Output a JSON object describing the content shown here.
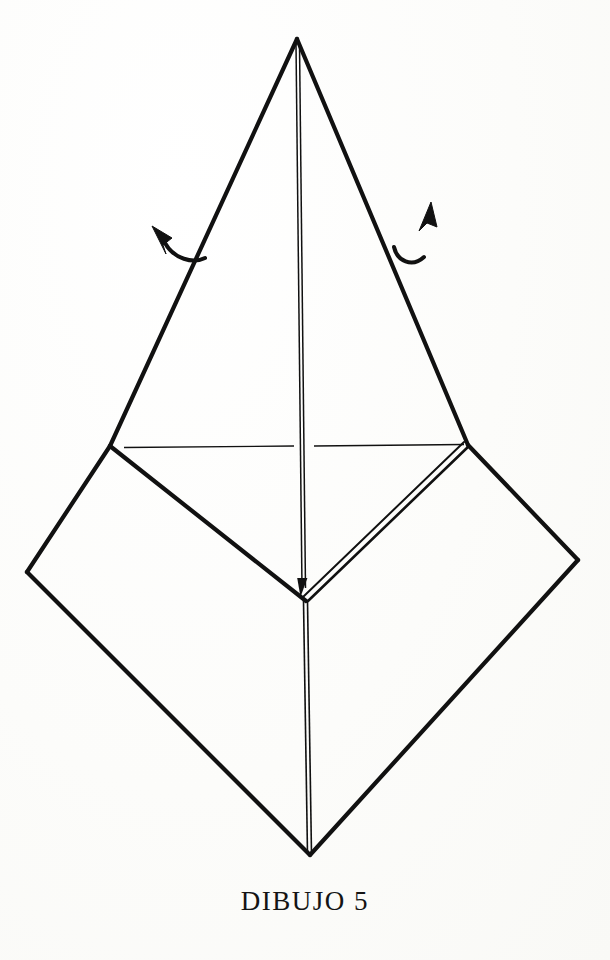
{
  "document": {
    "caption": "DIBUJO 5",
    "figure_title": "DIBUJO 5",
    "background_color": "#fdfdfc",
    "ink_color": "#111111"
  },
  "figure": {
    "type": "origami-fold-diagram",
    "stroke_color": "#111111",
    "thick_stroke_width": 4.2,
    "thin_stroke_width": 1.2,
    "points": {
      "apex": [
        297,
        37
      ],
      "left_junction": [
        110,
        446
      ],
      "right_junction": [
        468,
        445
      ],
      "center_v_junction": [
        306,
        600
      ],
      "diamond_left": [
        27,
        572
      ],
      "diamond_right": [
        578,
        560
      ],
      "diamond_bottom": [
        310,
        855
      ],
      "spine_top": [
        297,
        43
      ],
      "spine_mid": [
        303,
        460
      ],
      "spine_arrow_tip": [
        305,
        588
      ]
    },
    "edges": [
      {
        "name": "upper-left-edge",
        "from": "apex",
        "to": "left_junction",
        "style": "thick-single"
      },
      {
        "name": "upper-right-edge",
        "from": "apex",
        "to": "right_junction",
        "style": "thick-single"
      },
      {
        "name": "center-spine-upper",
        "from": "apex",
        "to": "spine_arrow_tip",
        "style": "thin-double"
      },
      {
        "name": "inner-left-diagonal",
        "from": "left_junction",
        "to": "center_v_junction",
        "style": "thick-single"
      },
      {
        "name": "inner-right-diagonal",
        "from": "right_junction",
        "to": "center_v_junction",
        "style": "thick-double"
      },
      {
        "name": "diamond-upper-left-edge",
        "from": "left_junction",
        "to": "diamond_left",
        "style": "thick-single"
      },
      {
        "name": "diamond-upper-right-edge",
        "from": "right_junction",
        "to": "diamond_right",
        "style": "thick-single"
      },
      {
        "name": "diamond-lower-left-edge",
        "from": "diamond_left",
        "to": "diamond_bottom",
        "style": "thick-single"
      },
      {
        "name": "diamond-lower-right-edge",
        "from": "diamond_right",
        "to": "diamond_bottom",
        "style": "thick-single"
      },
      {
        "name": "center-spine-lower",
        "from": "center_v_junction",
        "to": "diamond_bottom",
        "style": "thin-double"
      }
    ],
    "reference_line": {
      "name": "horizontal-crease-reference",
      "style": "thin-single",
      "left_segment": [
        [
          124,
          447
        ],
        [
          294,
          446
        ]
      ],
      "right_segment": [
        [
          314,
          446
        ],
        [
          464,
          444
        ]
      ]
    },
    "arrows": [
      {
        "name": "left-fold-arrow",
        "direction": "up-left",
        "tail": [
          203,
          257
        ],
        "head_tip": [
          152,
          226
        ],
        "description": "curved arrow indicating left flap folds upward/outward"
      },
      {
        "name": "right-fold-arrow",
        "direction": "up-right",
        "tail": [
          395,
          247
        ],
        "head_tip": [
          431,
          202
        ],
        "description": "curved arrow indicating right flap folds upward/outward"
      }
    ]
  }
}
